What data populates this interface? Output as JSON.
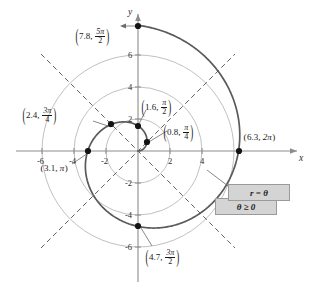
{
  "figure": {
    "title_text": "",
    "axes": {
      "x_label": "x",
      "y_label": "y",
      "x_ticks": [
        "-6",
        "-4",
        "-2",
        "2",
        "4"
      ],
      "y_ticks": [
        "6",
        "4",
        "2",
        "-2",
        "-4",
        "-6"
      ],
      "x_range": [
        -7.6,
        7.8
      ],
      "y_range": [
        -8.2,
        8.4
      ],
      "unit_px": 16
    },
    "callout": {
      "line1": "r = θ",
      "line2": "θ ≥ 0"
    },
    "point_labels": [
      {
        "id": "p-7-8",
        "r": "7.8",
        "theta_num": "5π",
        "theta_den": "2",
        "inline": false
      },
      {
        "id": "p-1-6",
        "r": "1.6",
        "theta_num": "π",
        "theta_den": "2",
        "inline": false
      },
      {
        "id": "p-0-8",
        "r": "0.8",
        "theta_num": "π",
        "theta_den": "4",
        "inline": false
      },
      {
        "id": "p-2-4",
        "r": "2.4",
        "theta_num": "3π",
        "theta_den": "4",
        "inline": false
      },
      {
        "id": "p-6-3",
        "r": "6.3",
        "theta_plain": "2π",
        "inline": true
      },
      {
        "id": "p-3-1",
        "r": "3.1",
        "theta_plain": "π",
        "inline": true
      },
      {
        "id": "p-4-7",
        "r": "4.7",
        "theta_num": "3π",
        "theta_den": "2",
        "inline": false
      }
    ]
  },
  "chart_data": {
    "type": "line",
    "xlabel": "x",
    "ylabel": "y",
    "xlim": [
      -7.6,
      7.8
    ],
    "ylim": [
      -8.2,
      8.4
    ],
    "grid": false,
    "coordinate_system": "polar",
    "curve": {
      "name": "r = θ",
      "equation": "r = theta",
      "domain": "theta >= 0",
      "theta_range_plotted": [
        0,
        7.85
      ],
      "color": "#5a5a5a"
    },
    "polar_grid_circles": [
      2,
      4,
      6
    ],
    "polar_grid_rays_deg": [
      45,
      135,
      225,
      315
    ],
    "annotations": [
      {
        "label": "(7.8, 5π/2)",
        "r": 7.8,
        "theta": "5π/2",
        "theta_rad": 7.854,
        "x": 0.0,
        "y": 7.8
      },
      {
        "label": "(1.6, π/2)",
        "r": 1.6,
        "theta": "π/2",
        "theta_rad": 1.571,
        "x": 0.0,
        "y": 1.6
      },
      {
        "label": "(0.8, π/4)",
        "r": 0.8,
        "theta": "π/4",
        "theta_rad": 0.785,
        "x": 0.57,
        "y": 0.57
      },
      {
        "label": "(2.4, 3π/4)",
        "r": 2.4,
        "theta": "3π/4",
        "theta_rad": 2.356,
        "x": -1.7,
        "y": 1.7
      },
      {
        "label": "(6.3, 2π)",
        "r": 6.3,
        "theta": "2π",
        "theta_rad": 6.283,
        "x": 6.3,
        "y": 0.0
      },
      {
        "label": "(3.1, π)",
        "r": 3.1,
        "theta": "π",
        "theta_rad": 3.142,
        "x": -3.1,
        "y": 0.0
      },
      {
        "label": "(4.7, 3π/2)",
        "r": 4.7,
        "theta": "3π/2",
        "theta_rad": 4.712,
        "x": 0.0,
        "y": -4.7
      }
    ],
    "xticks": [
      -6,
      -4,
      -2,
      2,
      4
    ],
    "yticks": [
      6,
      4,
      2,
      -2,
      -4,
      -6
    ]
  }
}
